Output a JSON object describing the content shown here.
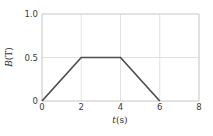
{
  "chart_data": {
    "type": "line",
    "title": "",
    "subtitle": "",
    "xlabel": "t(s)",
    "xlabel_italic_part": "t",
    "xlabel_rest": "(s)",
    "ylabel": "B(T)",
    "ylabel_italic_part": "B",
    "ylabel_rest": "(T)",
    "xlim": [
      0,
      8
    ],
    "ylim": [
      0,
      1.0
    ],
    "xticks": [
      0,
      2,
      4,
      6,
      8
    ],
    "xtick_labels": [
      "0",
      "2",
      "4",
      "6",
      "8"
    ],
    "yticks": [
      0,
      0.5,
      1.0
    ],
    "ytick_labels": [
      "0",
      "0.5",
      "1.0"
    ],
    "grid": true,
    "grid_axis": "both",
    "legend": null,
    "legend_position": "none",
    "series": [
      {
        "name": "B(t)",
        "color": "#4d4d4d",
        "linewidth": 1.6,
        "x": [
          0,
          2,
          4,
          6
        ],
        "y": [
          0,
          0.5,
          0.5,
          0
        ]
      }
    ],
    "annotations": []
  },
  "style": {
    "background": "#ffffff",
    "grid_color": "#d9d9d9",
    "axis_color": "#cfcfcf",
    "tick_text_color": "#3b3b3b",
    "label_text_color": "#2e2e2e",
    "line_color": "#4d4d4d"
  }
}
